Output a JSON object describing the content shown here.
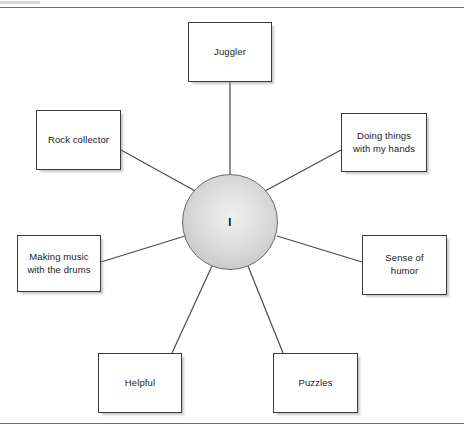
{
  "page": {
    "background_color": "#ffffff",
    "rule_color": "#6f6f6f",
    "box_border_color": "#3a3a3a",
    "text_color": "#1b1b1b",
    "hub_fill_color": "#d5d5d5",
    "connector_color": "#4a4a4a"
  },
  "hub": {
    "label": "I",
    "cx": 230,
    "cy": 222,
    "r": 48
  },
  "nodes": [
    {
      "id": "juggler",
      "label": "Juggler",
      "x": 188,
      "y": 22,
      "w": 84,
      "h": 60
    },
    {
      "id": "rock-collector",
      "label": "Rock collector",
      "x": 36,
      "y": 110,
      "w": 85,
      "h": 60
    },
    {
      "id": "doing-things",
      "label": "Doing things\nwith my hands",
      "x": 341,
      "y": 113,
      "w": 86,
      "h": 59
    },
    {
      "id": "making-music",
      "label": "Making music\nwith the drums",
      "x": 17,
      "y": 235,
      "w": 84,
      "h": 57
    },
    {
      "id": "sense-of-humor",
      "label": "Sense of\nhumor",
      "x": 362,
      "y": 235,
      "w": 85,
      "h": 60
    },
    {
      "id": "helpful",
      "label": "Helpful",
      "x": 98,
      "y": 353,
      "w": 84,
      "h": 60
    },
    {
      "id": "puzzles",
      "label": "Puzzles",
      "x": 273,
      "y": 353,
      "w": 85,
      "h": 60
    }
  ],
  "connectors": [
    {
      "from": "juggler",
      "x1": 230,
      "y1": 82,
      "x2": 230,
      "y2": 175
    },
    {
      "from": "rock-collector",
      "x1": 121,
      "y1": 150,
      "x2": 197,
      "y2": 192
    },
    {
      "from": "doing-things",
      "x1": 341,
      "y1": 150,
      "x2": 265,
      "y2": 191
    },
    {
      "from": "making-music",
      "x1": 101,
      "y1": 262,
      "x2": 185,
      "y2": 236
    },
    {
      "from": "sense-of-humor",
      "x1": 362,
      "y1": 262,
      "x2": 277,
      "y2": 236
    },
    {
      "from": "helpful",
      "x1": 172,
      "y1": 353,
      "x2": 212,
      "y2": 266
    },
    {
      "from": "puzzles",
      "x1": 283,
      "y1": 353,
      "x2": 248,
      "y2": 266
    }
  ]
}
